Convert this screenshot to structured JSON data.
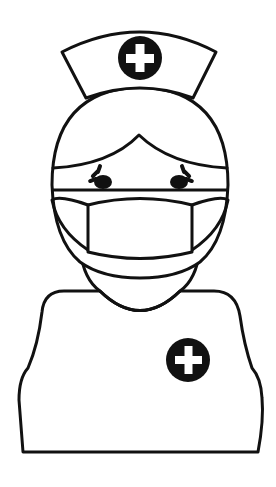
{
  "illustration": {
    "subject": "Nurse wearing face mask",
    "style": "black line art on white",
    "colors": {
      "background": "#ffffff",
      "line": "#111111",
      "badge_fill": "#111111",
      "cross_fill": "#ffffff"
    },
    "elements": {
      "cap": {
        "icon": "nurse-cap",
        "badge_icon": "plus-cross-icon"
      },
      "head": {
        "icon": "head"
      },
      "hair": {
        "icon": "hair"
      },
      "eyes": {
        "icon": "closed-eyes-with-lashes",
        "count": 2
      },
      "mask": {
        "icon": "surgical-mask"
      },
      "body": {
        "icon": "torso",
        "badge_icon": "plus-cross-icon"
      }
    }
  }
}
